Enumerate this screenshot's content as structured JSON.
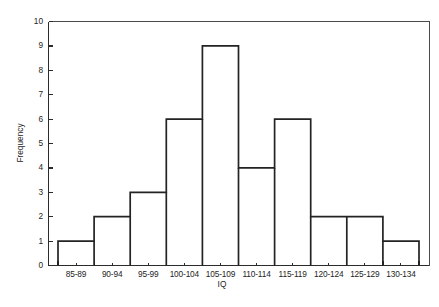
{
  "chart_data": {
    "type": "bar",
    "title": "",
    "subtitle": "",
    "xlabel": "IQ",
    "ylabel": "Frequency",
    "categories": [
      "85-89",
      "90-94",
      "95-99",
      "100-104",
      "105-109",
      "110-114",
      "115-119",
      "120-124",
      "125-129",
      "130-134"
    ],
    "values": [
      1,
      2,
      3,
      6,
      9,
      4,
      6,
      2,
      2,
      1
    ],
    "ylim": [
      0,
      10
    ],
    "ytick_labels": [
      "0",
      "1",
      "2",
      "3",
      "4",
      "5",
      "6",
      "7",
      "8",
      "9",
      "10"
    ],
    "ytick_values": [
      0,
      1,
      2,
      3,
      4,
      5,
      6,
      7,
      8,
      9,
      10
    ],
    "grid": false,
    "legend": false,
    "legend_position": "none",
    "bar_fill": "#ffffff",
    "bar_stroke": "#232323",
    "axis_color": "#2b2b2b",
    "background": "#ffffff",
    "annotations": []
  },
  "axes": {
    "x_axis_label": "IQ",
    "y_axis_label": "Frequency"
  }
}
